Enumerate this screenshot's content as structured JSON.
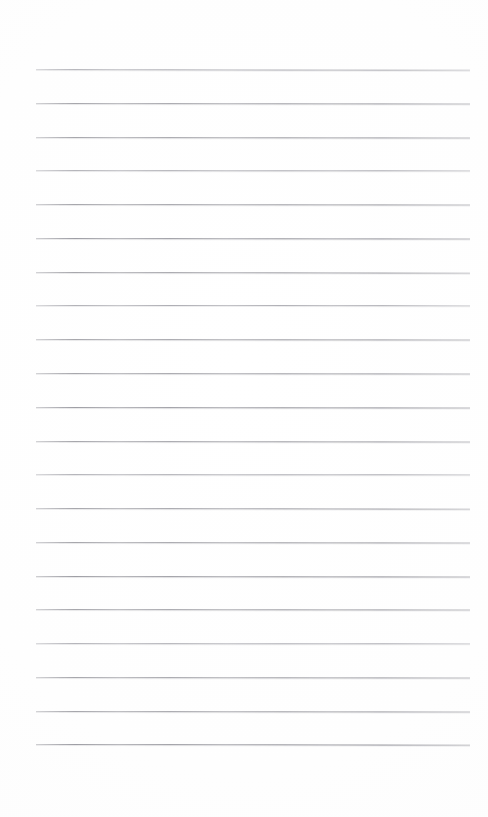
{
  "document": {
    "kind": "lined-paper-scan",
    "title": "Blank lined notebook page",
    "page_width": 488,
    "page_height": 817,
    "background_color": "#fefefe",
    "text_content": "",
    "visible_text_lines": [],
    "handwriting_present": "no",
    "printed_text_present": "no"
  },
  "ruling": {
    "line_color": "#9e9ea4",
    "line_thickness_px": 1,
    "line_count": 21,
    "left_margin_px": 36,
    "right_margin_px": 470,
    "line_length_px": 434,
    "first_line_y_px": 69,
    "last_line_y_px": 744,
    "line_spacing_px": 33.75,
    "top_blank_area_px": 69,
    "bottom_blank_area_px": 73,
    "margin_rule_present": "no",
    "lines": [
      {
        "index": 1,
        "y": 69,
        "x_start": 36,
        "x_end": 470,
        "tone": "faint",
        "tilt_deg": 0.1
      },
      {
        "index": 2,
        "y": 103,
        "x_start": 36,
        "x_end": 470,
        "tone": "normal",
        "tilt_deg": 0.06
      },
      {
        "index": 3,
        "y": 137,
        "x_start": 36,
        "x_end": 470,
        "tone": "normal",
        "tilt_deg": 0.08
      },
      {
        "index": 4,
        "y": 170,
        "x_start": 36,
        "x_end": 470,
        "tone": "faint",
        "tilt_deg": 0.04
      },
      {
        "index": 5,
        "y": 204,
        "x_start": 36,
        "x_end": 470,
        "tone": "normal",
        "tilt_deg": 0.07
      },
      {
        "index": 6,
        "y": 238,
        "x_start": 36,
        "x_end": 470,
        "tone": "dark",
        "tilt_deg": 0.05
      },
      {
        "index": 7,
        "y": 272,
        "x_start": 36,
        "x_end": 470,
        "tone": "normal",
        "tilt_deg": 0.09
      },
      {
        "index": 8,
        "y": 305,
        "x_start": 36,
        "x_end": 470,
        "tone": "faint",
        "tilt_deg": 0.03
      },
      {
        "index": 9,
        "y": 339,
        "x_start": 36,
        "x_end": 470,
        "tone": "normal",
        "tilt_deg": 0.06
      },
      {
        "index": 10,
        "y": 373,
        "x_start": 36,
        "x_end": 470,
        "tone": "normal",
        "tilt_deg": 0.08
      },
      {
        "index": 11,
        "y": 407,
        "x_start": 36,
        "x_end": 470,
        "tone": "dark",
        "tilt_deg": 0.05
      },
      {
        "index": 12,
        "y": 441,
        "x_start": 36,
        "x_end": 470,
        "tone": "normal",
        "tilt_deg": 0.07
      },
      {
        "index": 13,
        "y": 474,
        "x_start": 36,
        "x_end": 470,
        "tone": "faint",
        "tilt_deg": 0.04
      },
      {
        "index": 14,
        "y": 508,
        "x_start": 36,
        "x_end": 470,
        "tone": "normal",
        "tilt_deg": 0.09
      },
      {
        "index": 15,
        "y": 542,
        "x_start": 36,
        "x_end": 470,
        "tone": "normal",
        "tilt_deg": 0.06
      },
      {
        "index": 16,
        "y": 576,
        "x_start": 36,
        "x_end": 470,
        "tone": "dark",
        "tilt_deg": 0.05
      },
      {
        "index": 17,
        "y": 609,
        "x_start": 36,
        "x_end": 470,
        "tone": "normal",
        "tilt_deg": 0.08
      },
      {
        "index": 18,
        "y": 643,
        "x_start": 36,
        "x_end": 470,
        "tone": "faint",
        "tilt_deg": 0.04
      },
      {
        "index": 19,
        "y": 677,
        "x_start": 36,
        "x_end": 470,
        "tone": "normal",
        "tilt_deg": 0.07
      },
      {
        "index": 20,
        "y": 711,
        "x_start": 36,
        "x_end": 470,
        "tone": "normal",
        "tilt_deg": 0.06
      },
      {
        "index": 21,
        "y": 744,
        "x_start": 36,
        "x_end": 470,
        "tone": "dark",
        "tilt_deg": 0.09
      }
    ]
  }
}
